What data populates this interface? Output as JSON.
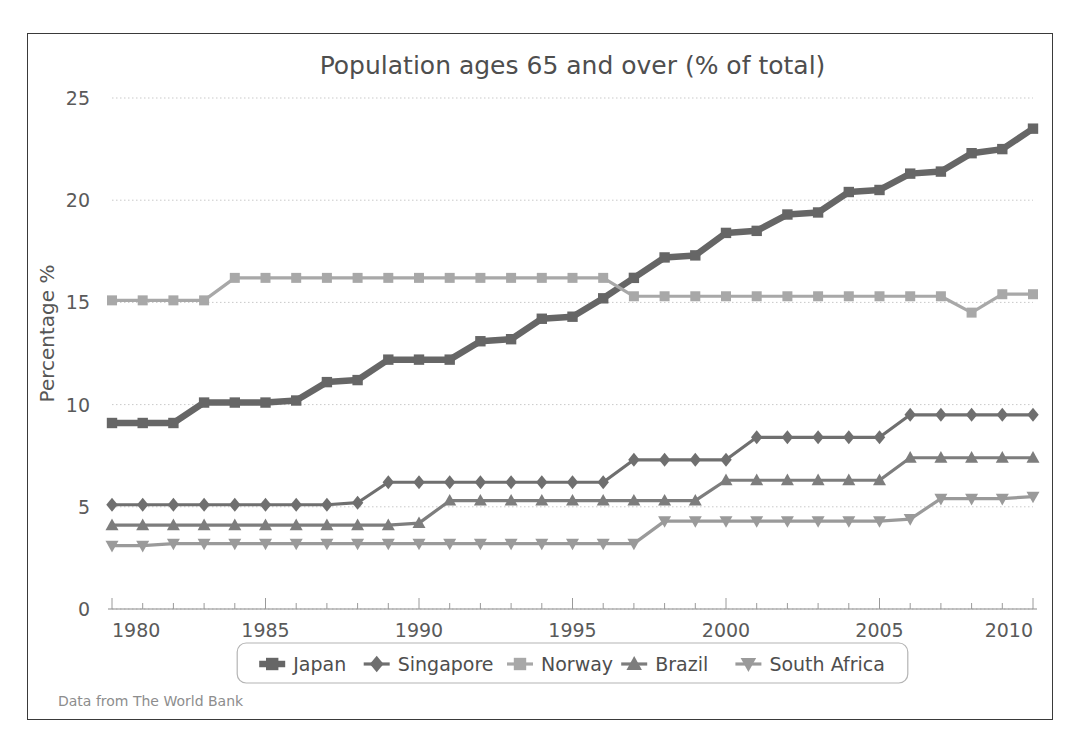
{
  "figure": {
    "title": "Population ages 65 and over (% of total)",
    "source_note": "Data from The World Bank",
    "background": "#ffffff",
    "frame_color": "#3a3a3a"
  },
  "axes": {
    "ylabel": "Percentage %",
    "xlabel": "",
    "y_ticks": [
      "0",
      "5",
      "10",
      "15",
      "20",
      "25"
    ],
    "x_ticks": [
      "1980",
      "1985",
      "1990",
      "1995",
      "2000",
      "2005",
      "2010"
    ]
  },
  "legend": {
    "position": "below-axes",
    "entries": [
      {
        "label": "Japan",
        "marker": "square",
        "color": "#666666"
      },
      {
        "label": "Singapore",
        "marker": "diamond",
        "color": "#6f6f6f"
      },
      {
        "label": "Norway",
        "marker": "square",
        "color": "#a8a8a8"
      },
      {
        "label": "Brazil",
        "marker": "triangle-up",
        "color": "#7d7d7d"
      },
      {
        "label": "South Africa",
        "marker": "triangle-down",
        "color": "#9a9a9a"
      }
    ]
  },
  "chart_data": {
    "type": "line",
    "title": "Population ages 65 and over (% of total)",
    "xlabel": "",
    "ylabel": "Percentage %",
    "xlim": [
      1980,
      2010
    ],
    "ylim": [
      0,
      25
    ],
    "grid": true,
    "grid_axis": "y",
    "legend": "bottom",
    "x": [
      1980,
      1981,
      1982,
      1983,
      1984,
      1985,
      1986,
      1987,
      1988,
      1989,
      1990,
      1991,
      1992,
      1993,
      1994,
      1995,
      1996,
      1997,
      1998,
      1999,
      2000,
      2001,
      2002,
      2003,
      2004,
      2005,
      2006,
      2007,
      2008,
      2009,
      2010
    ],
    "series": [
      {
        "name": "Japan",
        "marker": "square",
        "color": "#666666",
        "values": [
          9.1,
          9.1,
          9.1,
          10.1,
          10.1,
          10.1,
          10.2,
          11.1,
          11.2,
          12.2,
          12.2,
          12.2,
          13.1,
          13.2,
          14.2,
          14.3,
          15.2,
          16.2,
          17.2,
          17.3,
          18.4,
          18.5,
          19.3,
          19.4,
          20.4,
          20.5,
          21.3,
          21.4,
          22.3,
          22.5,
          23.5
        ]
      },
      {
        "name": "Singapore",
        "marker": "diamond",
        "color": "#6f6f6f",
        "values": [
          5.1,
          5.1,
          5.1,
          5.1,
          5.1,
          5.1,
          5.1,
          5.1,
          5.2,
          6.2,
          6.2,
          6.2,
          6.2,
          6.2,
          6.2,
          6.2,
          6.2,
          7.3,
          7.3,
          7.3,
          7.3,
          8.4,
          8.4,
          8.4,
          8.4,
          8.4,
          9.5,
          9.5,
          9.5,
          9.5,
          9.5
        ]
      },
      {
        "name": "Norway",
        "marker": "square",
        "color": "#a8a8a8",
        "values": [
          15.1,
          15.1,
          15.1,
          15.1,
          16.2,
          16.2,
          16.2,
          16.2,
          16.2,
          16.2,
          16.2,
          16.2,
          16.2,
          16.2,
          16.2,
          16.2,
          16.2,
          15.3,
          15.3,
          15.3,
          15.3,
          15.3,
          15.3,
          15.3,
          15.3,
          15.3,
          15.3,
          15.3,
          14.5,
          15.4,
          15.4
        ]
      },
      {
        "name": "Brazil",
        "marker": "triangle-up",
        "color": "#7d7d7d",
        "values": [
          4.1,
          4.1,
          4.1,
          4.1,
          4.1,
          4.1,
          4.1,
          4.1,
          4.1,
          4.1,
          4.2,
          5.3,
          5.3,
          5.3,
          5.3,
          5.3,
          5.3,
          5.3,
          5.3,
          5.3,
          6.3,
          6.3,
          6.3,
          6.3,
          6.3,
          6.3,
          7.4,
          7.4,
          7.4,
          7.4,
          7.4
        ]
      },
      {
        "name": "South Africa",
        "marker": "triangle-down",
        "color": "#9a9a9a",
        "values": [
          3.1,
          3.1,
          3.2,
          3.2,
          3.2,
          3.2,
          3.2,
          3.2,
          3.2,
          3.2,
          3.2,
          3.2,
          3.2,
          3.2,
          3.2,
          3.2,
          3.2,
          3.2,
          4.3,
          4.3,
          4.3,
          4.3,
          4.3,
          4.3,
          4.3,
          4.3,
          4.4,
          5.4,
          5.4,
          5.4,
          5.5
        ]
      }
    ]
  }
}
